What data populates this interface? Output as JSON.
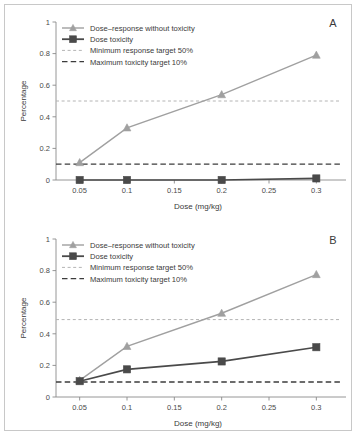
{
  "figure": {
    "panels": [
      {
        "letter": "A",
        "xlabel": "Dose (mg/kg)",
        "ylabel": "Percentage"
      },
      {
        "letter": "B",
        "xlabel": "Dose (mg/kg)",
        "ylabel": "Percentage"
      }
    ],
    "legend": [
      {
        "label": "Dose–response without toxicity",
        "marker": "triangle",
        "color": "#a0a0a0"
      },
      {
        "label": "Dose toxicity",
        "marker": "square",
        "color": "#4a4a4a"
      },
      {
        "label": "Minimum response target 50%",
        "marker": "dashed-light",
        "color": "#b4b4b4"
      },
      {
        "label": "Maximum toxicity target 10%",
        "marker": "dashed-dark",
        "color": "#3c3c3c"
      }
    ],
    "xticks": [
      "0.05",
      "0.1",
      "0.15",
      "0.2",
      "0.25",
      "0.3"
    ],
    "yticks": [
      "0",
      "0.2",
      "0.4",
      "0.6",
      "0.8",
      "1"
    ]
  },
  "chart_data": [
    {
      "type": "line",
      "title": "A",
      "xlabel": "Dose (mg/kg)",
      "ylabel": "Percentage",
      "x": [
        0.05,
        0.1,
        0.2,
        0.3
      ],
      "xlim": [
        0.025,
        0.325
      ],
      "ylim": [
        0,
        1
      ],
      "xticks": [
        0.05,
        0.1,
        0.15,
        0.2,
        0.25,
        0.3
      ],
      "yticks": [
        0,
        0.2,
        0.4,
        0.6,
        0.8,
        1
      ],
      "grid": false,
      "legend_position": "upper-left",
      "series": [
        {
          "name": "Dose–response without toxicity",
          "values": [
            0.11,
            0.33,
            0.54,
            0.79
          ],
          "marker": "triangle",
          "color": "#a0a0a0"
        },
        {
          "name": "Dose toxicity",
          "values": [
            0.0,
            0.0,
            0.0,
            0.01
          ],
          "marker": "square",
          "color": "#4a4a4a"
        }
      ],
      "reference_lines": [
        {
          "name": "Minimum response target 50%",
          "value": 0.5,
          "style": "dashed-light",
          "color": "#b4b4b4"
        },
        {
          "name": "Maximum toxicity target 10%",
          "value": 0.1,
          "style": "dashed-dark",
          "color": "#3c3c3c"
        }
      ]
    },
    {
      "type": "line",
      "title": "B",
      "xlabel": "Dose (mg/kg)",
      "ylabel": "Percentage",
      "x": [
        0.05,
        0.1,
        0.2,
        0.3
      ],
      "xlim": [
        0.025,
        0.325
      ],
      "ylim": [
        0,
        1
      ],
      "xticks": [
        0.05,
        0.1,
        0.15,
        0.2,
        0.25,
        0.3
      ],
      "yticks": [
        0,
        0.2,
        0.4,
        0.6,
        0.8,
        1
      ],
      "grid": false,
      "legend_position": "upper-left",
      "series": [
        {
          "name": "Dose–response without toxicity",
          "values": [
            0.105,
            0.32,
            0.53,
            0.775
          ],
          "marker": "triangle",
          "color": "#a0a0a0"
        },
        {
          "name": "Dose toxicity",
          "values": [
            0.1,
            0.175,
            0.225,
            0.315
          ],
          "marker": "square",
          "color": "#4a4a4a"
        }
      ],
      "reference_lines": [
        {
          "name": "Minimum response target 50%",
          "value": 0.49,
          "style": "dashed-light",
          "color": "#b4b4b4"
        },
        {
          "name": "Maximum toxicity target 10%",
          "value": 0.095,
          "style": "dashed-dark",
          "color": "#3c3c3c"
        }
      ]
    }
  ]
}
